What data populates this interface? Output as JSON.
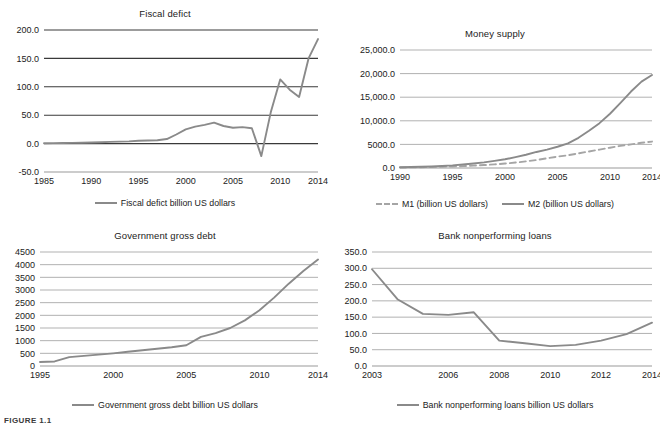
{
  "figure": {
    "caption_fragment": "FIGURE 1.1"
  },
  "chart_data": [
    {
      "id": "fiscal-deficit",
      "type": "line",
      "title": "Fiscal defict",
      "xlabel": "",
      "ylabel": "",
      "grid": true,
      "legend_position": "bottom",
      "ylim": [
        -50.0,
        200.0
      ],
      "yticks": [
        "-50.0",
        "0.0",
        "50.0",
        "100.0",
        "150.0",
        "200.0"
      ],
      "ytick_values": [
        -50,
        0,
        50,
        100,
        150,
        200
      ],
      "xlim": [
        1985,
        2014
      ],
      "xticks": [
        "1985",
        "1990",
        "1995",
        "2000",
        "2005",
        "2010",
        "2014"
      ],
      "xtick_values": [
        1985,
        1990,
        1995,
        2000,
        2005,
        2010,
        2014
      ],
      "series": [
        {
          "name": "Fiscal defict billion US dollars",
          "style": "solid",
          "color": "#8a8a8a",
          "x": [
            1985,
            1986,
            1987,
            1988,
            1989,
            1990,
            1991,
            1992,
            1993,
            1994,
            1995,
            1996,
            1997,
            1998,
            1999,
            2000,
            2001,
            2002,
            2003,
            2004,
            2005,
            2006,
            2007,
            2008,
            2009,
            2010,
            2011,
            2012,
            2013,
            2014
          ],
          "values": [
            0.5,
            0.8,
            1.0,
            1.2,
            1.5,
            2.0,
            2.5,
            3.0,
            3.5,
            4.0,
            5.0,
            5.5,
            6.0,
            8.0,
            16.0,
            25.0,
            30.0,
            33.0,
            37.0,
            31.0,
            28.0,
            29.0,
            27.0,
            -22.0,
            55.0,
            113.0,
            95.0,
            82.0,
            150.0,
            184.0
          ]
        }
      ]
    },
    {
      "id": "money-supply",
      "type": "line",
      "title": "Money supply",
      "xlabel": "",
      "ylabel": "",
      "grid": true,
      "legend_position": "bottom",
      "ylim": [
        0.0,
        25000.0
      ],
      "yticks": [
        "0.0",
        "5000.0",
        "10,000.0",
        "15,000.0",
        "20,000.0",
        "25,000.0"
      ],
      "ytick_values": [
        0,
        5000,
        10000,
        15000,
        20000,
        25000
      ],
      "xlim": [
        1990,
        2014
      ],
      "xticks": [
        "1990",
        "1995",
        "2000",
        "2005",
        "2010",
        "2014"
      ],
      "xtick_values": [
        1990,
        1995,
        2000,
        2005,
        2010,
        2014
      ],
      "series": [
        {
          "name": "M1 (billion US dollars)",
          "style": "dashed",
          "color": "#a5a5a5",
          "x": [
            1990,
            1991,
            1992,
            1993,
            1994,
            1995,
            1996,
            1997,
            1998,
            1999,
            2000,
            2001,
            2002,
            2003,
            2004,
            2005,
            2006,
            2007,
            2008,
            2009,
            2010,
            2011,
            2012,
            2013,
            2014
          ],
          "values": [
            100,
            130,
            170,
            210,
            260,
            320,
            400,
            500,
            620,
            770,
            950,
            1150,
            1400,
            1700,
            2050,
            2400,
            2700,
            3100,
            3500,
            3900,
            4300,
            4700,
            5000,
            5350,
            5600
          ]
        },
        {
          "name": "M2 (billion US dollars)",
          "style": "solid",
          "color": "#8a8a8a",
          "x": [
            1990,
            1991,
            1992,
            1993,
            1994,
            1995,
            1996,
            1997,
            1998,
            1999,
            2000,
            2001,
            2002,
            2003,
            2004,
            2005,
            2006,
            2007,
            2008,
            2009,
            2010,
            2011,
            2012,
            2013,
            2014
          ],
          "values": [
            150,
            200,
            260,
            330,
            430,
            560,
            740,
            960,
            1200,
            1500,
            1850,
            2300,
            2800,
            3400,
            3900,
            4500,
            5200,
            6400,
            7900,
            9500,
            11500,
            13800,
            16200,
            18300,
            19700
          ]
        }
      ]
    },
    {
      "id": "government-gross-debt",
      "type": "line",
      "title": "Government gross debt",
      "xlabel": "",
      "ylabel": "",
      "grid": true,
      "legend_position": "bottom",
      "ylim": [
        0,
        4500
      ],
      "yticks": [
        "0",
        "500",
        "1000",
        "1500",
        "2000",
        "2500",
        "3000",
        "3500",
        "4000",
        "4500"
      ],
      "ytick_values": [
        0,
        500,
        1000,
        1500,
        2000,
        2500,
        3000,
        3500,
        4000,
        4500
      ],
      "xlim": [
        1995,
        2014
      ],
      "xticks": [
        "1995",
        "2000",
        "2005",
        "2010",
        "2014"
      ],
      "xtick_values": [
        1995,
        2000,
        2005,
        2010,
        2014
      ],
      "series": [
        {
          "name": "Government gross debt billion US dollars",
          "style": "solid",
          "color": "#8a8a8a",
          "x": [
            1995,
            1996,
            1997,
            1998,
            1999,
            2000,
            2001,
            2002,
            2003,
            2004,
            2005,
            2006,
            2007,
            2008,
            2009,
            2010,
            2011,
            2012,
            2013,
            2014
          ],
          "values": [
            160,
            180,
            350,
            400,
            450,
            500,
            560,
            620,
            680,
            740,
            820,
            1150,
            1300,
            1500,
            1800,
            2200,
            2700,
            3250,
            3750,
            4200
          ]
        }
      ]
    },
    {
      "id": "bank-nonperforming-loans",
      "type": "line",
      "title": "Bank nonperforming loans",
      "xlabel": "",
      "ylabel": "",
      "grid": true,
      "legend_position": "bottom",
      "ylim": [
        0.0,
        350.0
      ],
      "yticks": [
        "0.0",
        "50.0",
        "100.0",
        "150.0",
        "200.0",
        "250.0",
        "300.0",
        "350.0"
      ],
      "ytick_values": [
        0,
        50,
        100,
        150,
        200,
        250,
        300,
        350
      ],
      "xlim": [
        2003,
        2014
      ],
      "xticks": [
        "2003",
        "2006",
        "2008",
        "2010",
        "2012",
        "2014"
      ],
      "xtick_values": [
        2003,
        2006,
        2008,
        2010,
        2012,
        2014
      ],
      "series": [
        {
          "name": "Bank nonperforming loans billion US dollars",
          "style": "solid",
          "color": "#8a8a8a",
          "x": [
            2003,
            2004,
            2005,
            2006,
            2007,
            2008,
            2009,
            2010,
            2011,
            2012,
            2013,
            2014
          ],
          "values": [
            297,
            205,
            160,
            157,
            165,
            78,
            70,
            61,
            65,
            78,
            98,
            133
          ]
        }
      ]
    }
  ]
}
